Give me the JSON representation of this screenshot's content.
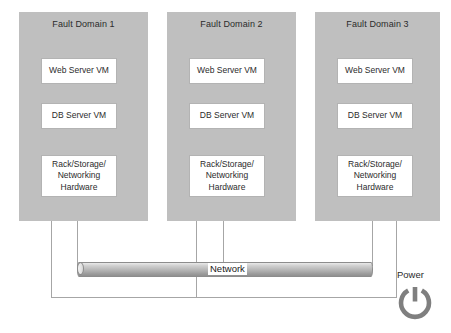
{
  "diagram": {
    "colors": {
      "domain_fill": "#bfbfbf",
      "box_fill": "#ffffff",
      "box_border": "#b3b3b3",
      "line": "#a6a6a6",
      "cylinder_fill": "#b4b4b4",
      "power_icon": "#7f7f7f",
      "text": "#2b2b2b",
      "background": "#ffffff"
    },
    "fault_domains": [
      {
        "title": "Fault Domain 1",
        "components": [
          {
            "label": "Web Server VM"
          },
          {
            "label": "DB Server VM"
          },
          {
            "label": "Rack/Storage/\nNetworking\nHardware",
            "lines": [
              "Rack/Storage/",
              "Networking",
              "Hardware"
            ]
          }
        ]
      },
      {
        "title": "Fault Domain 2",
        "components": [
          {
            "label": "Web Server VM"
          },
          {
            "label": "DB Server VM"
          },
          {
            "label": "Rack/Storage/\nNetworking\nHardware",
            "lines": [
              "Rack/Storage/",
              "Networking",
              "Hardware"
            ]
          }
        ]
      },
      {
        "title": "Fault Domain 3",
        "components": [
          {
            "label": "Web Server VM"
          },
          {
            "label": "DB Server VM"
          },
          {
            "label": "Rack/Storage/\nNetworking\nHardware",
            "lines": [
              "Rack/Storage/",
              "Networking",
              "Hardware"
            ]
          }
        ]
      }
    ],
    "network": {
      "label": "Network",
      "icon": "network-bus-cylinder"
    },
    "power": {
      "label": "Power",
      "icon": "power-icon"
    }
  }
}
